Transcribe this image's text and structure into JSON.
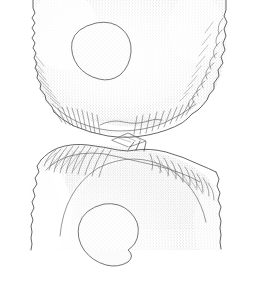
{
  "figure": {
    "technique": "Ink stipple and line hatching archaeological illustration",
    "background_color": "#ffffff",
    "ink_color": "#4a4a4a",
    "stipple_color": "#8e8e8e",
    "width_px": 259,
    "height_px": 283,
    "caption": "",
    "scale_bar": "",
    "labels": []
  },
  "pieces": [
    {
      "id": "upper-fragment",
      "name": "Upper fragment",
      "position": "top",
      "orientation": "ventral face, distal end upward",
      "outline_color": "#4a4a4a",
      "features": [
        {
          "name": "cortex-inclusion",
          "shape": "irregular rounded blob",
          "cx": 101,
          "cy": 51,
          "rx": 31,
          "ry": 28
        },
        {
          "name": "retouched-lateral-edge-left",
          "side": "left",
          "scar_count": 14
        },
        {
          "name": "retouched-lateral-edge-right",
          "side": "right",
          "scar_count": 16
        },
        {
          "name": "retouched-basal-edge",
          "side": "bottom",
          "scar_count": 20
        },
        {
          "name": "stipple-shading-field",
          "side": "interior",
          "density": "medium"
        }
      ]
    },
    {
      "id": "lower-fragment",
      "name": "Lower fragment",
      "position": "bottom",
      "orientation": "ventral face, proximal end downward",
      "outline_color": "#4a4a4a",
      "features": [
        {
          "name": "cortex-inclusion",
          "shape": "irregular rounded blob",
          "cx": 108,
          "cy": 232,
          "rx": 30,
          "ry": 28
        },
        {
          "name": "retouched-dorsal-edge-left",
          "side": "upper-left",
          "scar_count": 15
        },
        {
          "name": "retouched-dorsal-edge-right",
          "side": "upper-right",
          "scar_count": 15
        },
        {
          "name": "bulbar-ridge",
          "side": "top-centre",
          "scar_count": 6
        },
        {
          "name": "stipple-shading-field",
          "side": "interior",
          "density": "medium-high"
        }
      ]
    }
  ],
  "refit_junction": {
    "name": "break-plane",
    "description": "Fracture surface where the two fragments conjoin",
    "y_center": 133,
    "lozenge_marker": {
      "name": "bulb-of-percussion",
      "cx": 126,
      "cy": 140
    }
  },
  "icons": {
    "inclusion": "blob-icon",
    "scar": "flake-scar-icon",
    "stipple": "stipple-shading-icon"
  }
}
